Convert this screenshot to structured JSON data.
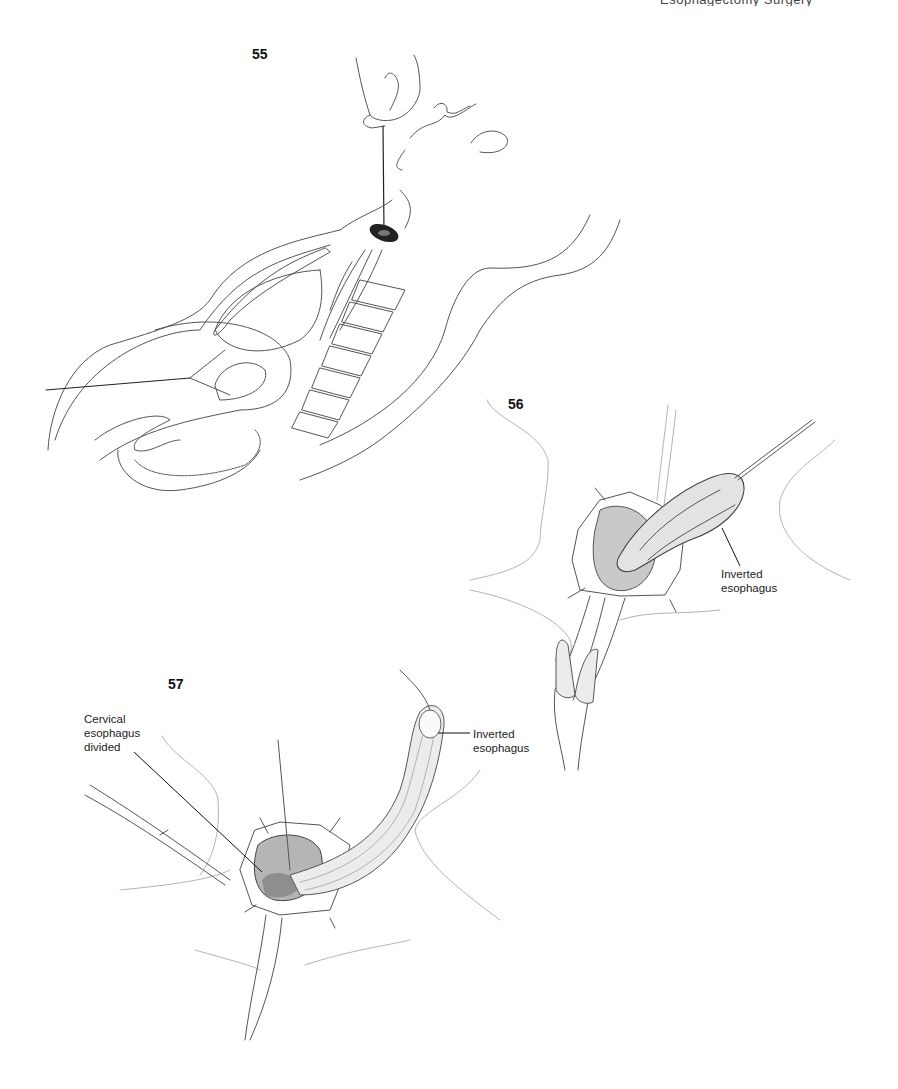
{
  "page": {
    "header_text": "Esophagectomy Surgery"
  },
  "figures": [
    {
      "number": "55",
      "description": "Sagittal view: stripper passed through esophagus from abdomen, exiting through cervical incision",
      "labels": []
    },
    {
      "number": "56",
      "description": "Esophagus being inverted and withdrawn through cervical incision",
      "labels": [
        {
          "text": "Inverted\nesophagus"
        }
      ]
    },
    {
      "number": "57",
      "description": "Fully inverted esophagus delivered through neck; cervical esophagus divided",
      "labels": [
        {
          "text": "Cervical\nesophagus\ndivided"
        },
        {
          "text": "Inverted\nesophagus"
        }
      ]
    }
  ],
  "colors": {
    "background": "#ffffff",
    "line": "#555555",
    "text": "#222222"
  }
}
